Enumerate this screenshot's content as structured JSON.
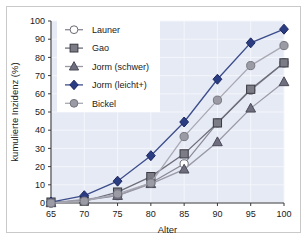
{
  "chart_data": {
    "type": "line",
    "title": "",
    "subtitle": "",
    "xlabel": "Alter",
    "ylabel": "kumulierte Inzidenz (%)",
    "x": [
      65,
      70,
      75,
      80,
      85,
      90,
      95,
      100
    ],
    "xlim": [
      65,
      100
    ],
    "ylim": [
      0,
      100
    ],
    "xticks": [
      65,
      70,
      75,
      80,
      85,
      90,
      95,
      100
    ],
    "yticks": [
      0,
      10,
      20,
      30,
      40,
      50,
      60,
      70,
      80,
      90,
      100
    ],
    "grid": true,
    "legend_position": "upper-left",
    "series": [
      {
        "name": "Launer",
        "marker": "open-circle",
        "color": "#ffffff",
        "edge_color": "#6b6b75",
        "line_color": "#8a8a96",
        "values": [
          0,
          1.5,
          4,
          11,
          21.5,
          44,
          62,
          77
        ]
      },
      {
        "name": "Gao",
        "marker": "square",
        "color": "#7c7c86",
        "edge_color": "#3a3a44",
        "line_color": "#6e6e7a",
        "values": [
          0.5,
          1,
          6,
          14.5,
          27,
          44,
          62.5,
          77
        ]
      },
      {
        "name": "Jorm (schwer)",
        "marker": "triangle",
        "color": "#6e6e7e",
        "edge_color": "#4a4a58",
        "line_color": "#9a9aa6",
        "values": [
          0,
          2,
          4,
          10.5,
          18.5,
          33.5,
          52,
          66.5
        ]
      },
      {
        "name": "Jorm (leicht+)",
        "marker": "diamond",
        "color": "#2b3d82",
        "edge_color": "#1b2660",
        "line_color": "#3c4d8c",
        "values": [
          0.5,
          4,
          12,
          26,
          44.5,
          68,
          88,
          95.5
        ]
      },
      {
        "name": "Bickel",
        "marker": "circle",
        "color": "#9b9ba6",
        "edge_color": "#76767f",
        "line_color": "#a9a9b4",
        "values": [
          0,
          1,
          5,
          11,
          36.5,
          56.5,
          75.5,
          86.5
        ]
      }
    ]
  },
  "style": {
    "plot_background": "#e6eaf4",
    "grid_color": "#f4f6fb",
    "axis_color": "#3a3a3a",
    "frame_color": "#c9c9c9",
    "legend_background": "#ffffff",
    "text_color": "#1a1a1a"
  }
}
